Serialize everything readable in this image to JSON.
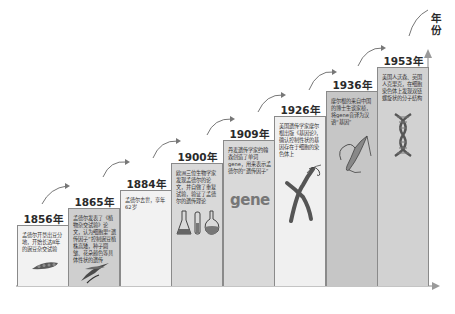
{
  "axis": {
    "y_label": "年份",
    "line_color": "#8a8a8a"
  },
  "colors": {
    "light_box": "#f2f2f2",
    "mid_box": "#d9d9d9",
    "dark_box": "#c6c6c6",
    "border": "#8a8a8a",
    "text": "#333333",
    "arrow": "#666666"
  },
  "timeline": [
    {
      "year": "1856年",
      "text": "孟德尔开垦出豆分地，开始长达8年的豌豆杂交试验",
      "illustration": "pea-pod-icon"
    },
    {
      "year": "1865年",
      "text": "孟德尔发表了《植物杂交试验》论文，认为细胞里“遗传因子”控制豌豆植株高矮，种子圆皱、花朵颜色等具体性状的遗传",
      "illustration": "pea-plant-icon"
    },
    {
      "year": "1884年",
      "text": "孟德尔去世，享年62岁",
      "illustration": ""
    },
    {
      "year": "1900年",
      "text": "欧洲三位生物学家发现孟德尔的论文，并自做了重复试验，验证了孟德尔的遗传理论",
      "illustration": "lab-flasks-icon"
    },
    {
      "year": "1909年",
      "text": "丹麦遗传学家约翰森创造了单词gene，用来表示孟德尔的“遗传因子”",
      "illustration": "gene-word-icon",
      "illustration_text": "gene"
    },
    {
      "year": "1926年",
      "text": "美国遗传学家摩尔根出版《基因论》，确认控制性状的基因存在于细胞的染色体上",
      "illustration": "chromosome-icon"
    },
    {
      "year": "1936年",
      "text": "摩尔根的来自中国的博士生谈家桢，将gene音译为汉语“基因”",
      "illustration": "chromosome-strand-icon"
    },
    {
      "year": "1953年",
      "text": "美国人沃森、英国人克里克，在细胞染色体上发现双链螺旋状的分子结构",
      "illustration": "dna-helix-icon"
    }
  ]
}
